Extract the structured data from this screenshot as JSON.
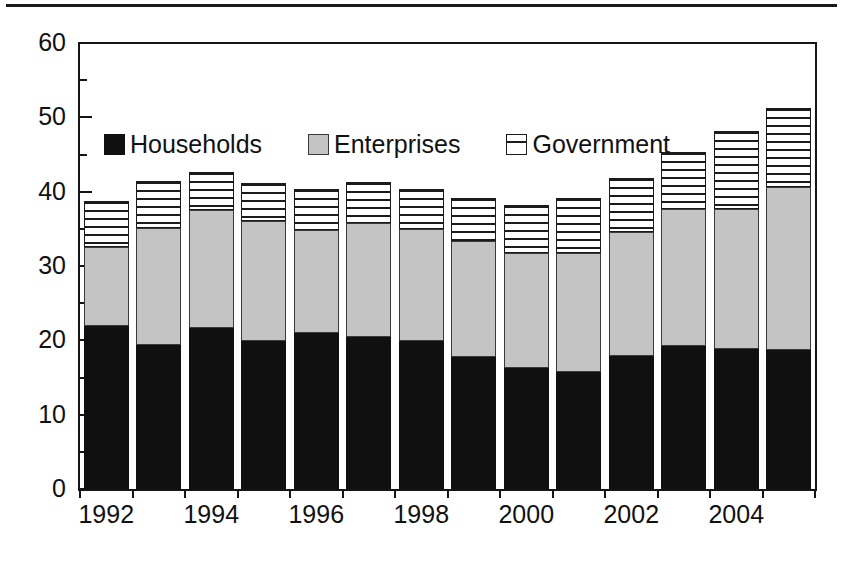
{
  "figure": {
    "has_top_rule": true,
    "background_color": "#ffffff"
  },
  "legend": {
    "position": "inside-top-left",
    "entries": [
      {
        "label": "Households",
        "swatch": "solid-black-square-icon",
        "color": "#101010"
      },
      {
        "label": "Enterprises",
        "swatch": "solid-gray-square-icon",
        "color": "#c4c4c4"
      },
      {
        "label": "Government",
        "swatch": "horizontal-stripe-square-icon",
        "color": "#ffffff"
      }
    ]
  },
  "axes": {
    "y_major_ticks": [
      "0",
      "10",
      "20",
      "30",
      "40",
      "50",
      "60"
    ],
    "y_major_values": [
      0,
      10,
      20,
      30,
      40,
      50,
      60
    ],
    "y_minor_values": [
      5,
      15,
      25,
      35,
      45,
      55
    ],
    "x_tick_labels": [
      "1992",
      "1994",
      "1996",
      "1998",
      "2000",
      "2002",
      "2004"
    ]
  },
  "chart_data": {
    "type": "bar",
    "stacked": true,
    "title": "",
    "subtitle": "",
    "xlabel": "",
    "ylabel": "",
    "ylim": [
      0,
      60
    ],
    "grid": false,
    "legend_position": "upper left inside plot",
    "categories": [
      "1992",
      "1993",
      "1994",
      "1995",
      "1996",
      "1997",
      "1998",
      "1999",
      "2000",
      "2001",
      "2002",
      "2003",
      "2004",
      "2005"
    ],
    "series": [
      {
        "name": "Households",
        "color": "#101010",
        "values": [
          21.9,
          19.4,
          21.6,
          19.9,
          21.0,
          20.4,
          19.9,
          17.8,
          16.3,
          15.7,
          17.9,
          19.2,
          18.9,
          18.7
        ]
      },
      {
        "name": "Enterprises",
        "color": "#c4c4c4",
        "values": [
          10.7,
          15.7,
          15.9,
          16.1,
          13.9,
          15.4,
          15.1,
          15.6,
          15.4,
          16.0,
          16.7,
          18.5,
          18.8,
          21.9
        ]
      },
      {
        "name": "Government",
        "color": "#ffffff",
        "values": [
          6.1,
          6.3,
          5.1,
          5.2,
          5.4,
          5.5,
          5.4,
          5.7,
          6.5,
          7.5,
          7.3,
          7.6,
          10.4,
          10.7
        ]
      }
    ],
    "totals": [
      38.7,
      41.4,
      42.6,
      41.2,
      40.3,
      41.3,
      40.4,
      39.1,
      38.2,
      39.2,
      41.9,
      45.3,
      48.1,
      51.3
    ],
    "cumulative_tops": {
      "households": [
        21.9,
        19.4,
        21.6,
        19.9,
        21.0,
        20.4,
        19.9,
        17.8,
        16.3,
        15.7,
        17.9,
        19.2,
        18.9,
        18.7
      ],
      "enterprises": [
        32.6,
        35.1,
        37.5,
        36.0,
        34.9,
        35.8,
        35.0,
        33.4,
        31.7,
        31.7,
        34.6,
        37.7,
        37.7,
        40.6
      ],
      "government": [
        38.7,
        41.4,
        42.6,
        41.2,
        40.3,
        41.3,
        40.4,
        39.1,
        38.2,
        39.2,
        41.9,
        45.3,
        48.1,
        51.3
      ]
    }
  }
}
